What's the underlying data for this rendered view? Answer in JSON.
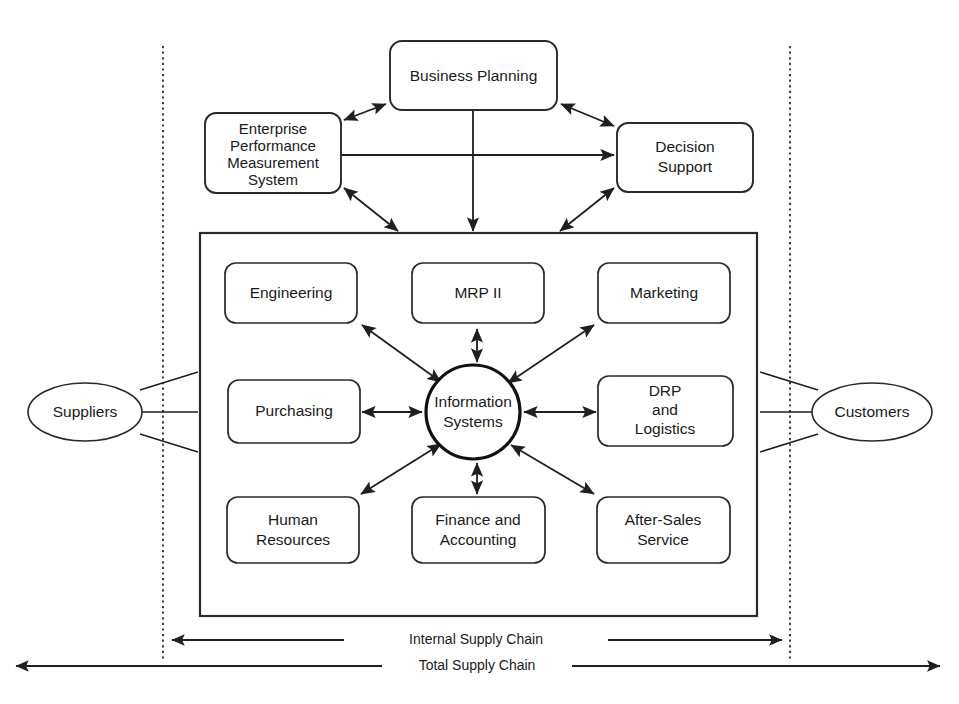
{
  "diagram": {
    "type": "block-diagram",
    "background_color": "#ffffff",
    "line_color": "#1f1f1f",
    "text_color": "#1a1a1a"
  },
  "top_boxes": {
    "business_planning": {
      "label": "Business Planning"
    },
    "epm_system": {
      "line1": "Enterprise",
      "line2": "Performance",
      "line3": "Measurement",
      "line4": "System"
    },
    "decision_support": {
      "line1": "Decision",
      "line2": "Support"
    }
  },
  "hub": {
    "line1": "Information",
    "line2": "Systems"
  },
  "function_boxes": [
    {
      "id": "engineering",
      "label": "Engineering",
      "lines": [
        "Engineering"
      ]
    },
    {
      "id": "mrp-ii",
      "label": "MRP II",
      "lines": [
        "MRP II"
      ]
    },
    {
      "id": "marketing",
      "label": "Marketing",
      "lines": [
        "Marketing"
      ]
    },
    {
      "id": "purchasing",
      "label": "Purchasing",
      "lines": [
        "Purchasing"
      ]
    },
    {
      "id": "drp-and-logistics",
      "label": "DRP and Logistics",
      "lines": [
        "DRP",
        "and",
        "Logistics"
      ]
    },
    {
      "id": "human-resources",
      "label": "Human Resources",
      "lines": [
        "Human",
        "Resources"
      ]
    },
    {
      "id": "finance-and-accounting",
      "label": "Finance and Accounting",
      "lines": [
        "Finance and",
        "Accounting"
      ]
    },
    {
      "id": "after-sales-service",
      "label": "After-Sales Service",
      "lines": [
        "After-Sales",
        "Service"
      ]
    }
  ],
  "external_entities": {
    "suppliers": {
      "label": "Suppliers"
    },
    "customers": {
      "label": "Customers"
    }
  },
  "chain_labels": {
    "internal": "Internal Supply Chain",
    "total": "Total Supply Chain"
  }
}
